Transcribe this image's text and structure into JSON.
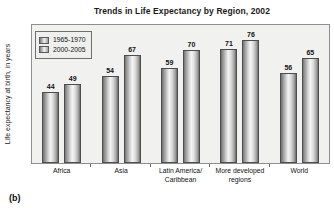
{
  "figure": {
    "caption": "(b)"
  },
  "chart_data": {
    "type": "bar",
    "title": "Trends in Life Expectancy by Region, 2002",
    "xlabel": "",
    "ylabel": "Life expectancy at birth, in years",
    "ylim": [
      0,
      80
    ],
    "grid": false,
    "legend_position": "top-left",
    "categories": [
      "Africa",
      "Latin America/ Caribbean",
      "Asia",
      "More developed regions",
      "World"
    ],
    "category_lines": [
      {
        "line1": "Africa",
        "line2": ""
      },
      {
        "line1": "Asia",
        "line2": ""
      },
      {
        "line1": "Latin America/",
        "line2": "Caribbean"
      },
      {
        "line1": "More developed",
        "line2": "regions"
      },
      {
        "line1": "World",
        "line2": ""
      }
    ],
    "series": [
      {
        "name": "1965-1970",
        "values": [
          44,
          54,
          59,
          71,
          56
        ]
      },
      {
        "name": "2000-2005",
        "values": [
          49,
          67,
          70,
          76,
          65
        ]
      }
    ],
    "colors": {
      "series1": "#c9c9c9",
      "series2": "#cfcfcf",
      "plot_background": "#f1f1ef",
      "frame": "#8e8e8e",
      "text": "#111111"
    }
  }
}
